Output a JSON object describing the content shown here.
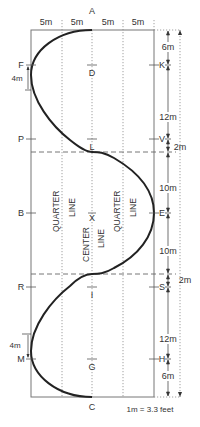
{
  "diagram": {
    "top_letter": "A",
    "bottom_letter": "C",
    "column_widths": [
      "5m",
      "5m",
      "5m",
      "5m"
    ],
    "left_letters": [
      "F",
      "P",
      "B",
      "R",
      "M"
    ],
    "right_letters": [
      "K",
      "V",
      "E",
      "S",
      "H"
    ],
    "center_letters": [
      "D",
      "L",
      "X",
      "I",
      "G"
    ],
    "left_measures": [
      "4m",
      "4m"
    ],
    "right_measures": [
      "6m",
      "12m",
      "2m",
      "10m",
      "10m",
      "2m",
      "12m",
      "6m"
    ],
    "quarter_line_label_1": "QUARTER",
    "quarter_line_label_2": "LINE",
    "center_line_label_1": "CENTER",
    "center_line_label_2": "LINE",
    "conversion_note": "1m = 3.3 feet"
  },
  "colors": {
    "line": "#777777",
    "path": "#222222",
    "dotted": "#888888",
    "text": "#333333"
  }
}
